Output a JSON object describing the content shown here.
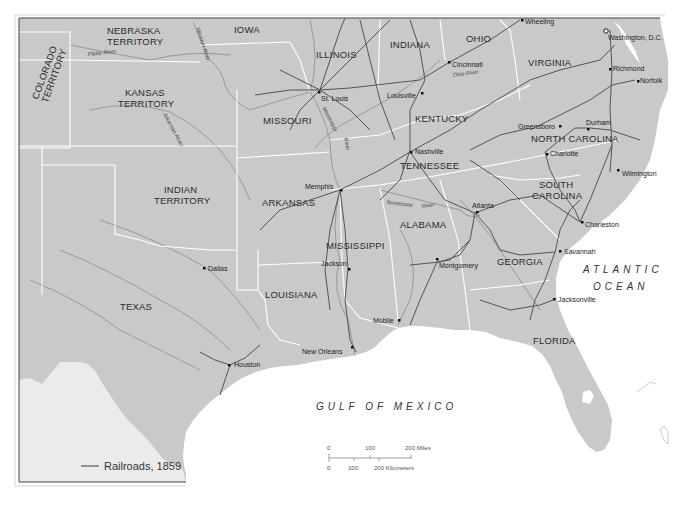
{
  "map": {
    "legend": {
      "label": "Railroads, 1859",
      "line_color": "#555555"
    },
    "colors": {
      "land": "#c9c9c9",
      "land_mexico": "#e8e8e8",
      "water": "#ffffff",
      "state_border": "#ffffff",
      "river": "#8a8a8a",
      "railroad": "#555555",
      "frame": "#444444"
    },
    "states": [
      {
        "name": "NEBRASKA",
        "line2": "TERRITORY"
      },
      {
        "name": "IOWA"
      },
      {
        "name": "COLORADO",
        "line2": "TERRITORY"
      },
      {
        "name": "ILLINOIS"
      },
      {
        "name": "INDIANA"
      },
      {
        "name": "OHIO"
      },
      {
        "name": "VIRGINIA"
      },
      {
        "name": "KANSAS",
        "line2": "TERRITORY"
      },
      {
        "name": "MISSOURI"
      },
      {
        "name": "KENTUCKY"
      },
      {
        "name": "NORTH CAROLINA"
      },
      {
        "name": "TENNESSEE"
      },
      {
        "name": "INDIAN",
        "line2": "TERRITORY"
      },
      {
        "name": "ARKANSAS"
      },
      {
        "name": "SOUTH",
        "line2": "CAROLINA"
      },
      {
        "name": "ALABAMA"
      },
      {
        "name": "MISSISSIPPI"
      },
      {
        "name": "GEORGIA"
      },
      {
        "name": "TEXAS"
      },
      {
        "name": "LOUISIANA"
      },
      {
        "name": "FLORIDA"
      }
    ],
    "cities": [
      {
        "name": "Wheeling"
      },
      {
        "name": "Washington, D.C."
      },
      {
        "name": "Cincinnati"
      },
      {
        "name": "Richmond"
      },
      {
        "name": "Norfolk"
      },
      {
        "name": "St. Louis"
      },
      {
        "name": "Louisville"
      },
      {
        "name": "Greensboro"
      },
      {
        "name": "Durham"
      },
      {
        "name": "Nashville"
      },
      {
        "name": "Charlotte"
      },
      {
        "name": "Wilmington"
      },
      {
        "name": "Memphis"
      },
      {
        "name": "Atlanta"
      },
      {
        "name": "Charleston"
      },
      {
        "name": "Savannah"
      },
      {
        "name": "Dallas"
      },
      {
        "name": "Jackson"
      },
      {
        "name": "Montgomery"
      },
      {
        "name": "Jacksonville"
      },
      {
        "name": "Mobile"
      },
      {
        "name": "New Orleans"
      },
      {
        "name": "Houston"
      }
    ],
    "rivers": [
      {
        "name": "Platte River"
      },
      {
        "name": "Missouri River"
      },
      {
        "name": "Ohio River"
      },
      {
        "name": "Arkansas River"
      },
      {
        "name": "Mississippi"
      },
      {
        "name": "River"
      },
      {
        "name": "Tennessee"
      },
      {
        "name": "River"
      }
    ],
    "oceans": [
      {
        "name": "ATLANTIC"
      },
      {
        "name": "OCEAN"
      },
      {
        "name": "GULF OF MEXICO"
      }
    ],
    "scale": {
      "miles": [
        "0",
        "100",
        "200 Miles"
      ],
      "km": [
        "0",
        "100",
        "200 Kilometers"
      ]
    }
  }
}
